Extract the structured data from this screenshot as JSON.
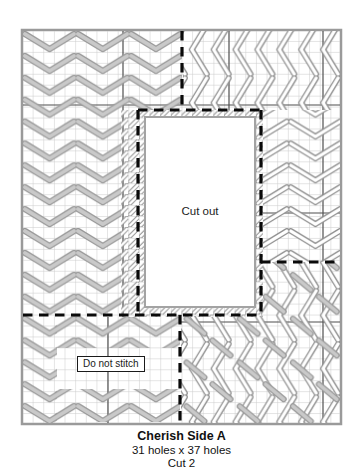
{
  "chart": {
    "cutout_label": "Cut out",
    "do_not_stitch_label": "Do not stitch"
  },
  "caption": {
    "title": "Cherish Side A",
    "size": "31 holes x 37 holes",
    "cut": "Cut 2"
  },
  "legend_colors": {
    "stitch_gray_fill": "#c9c9c9",
    "stitch_white_fill": "#ffffff",
    "stitch_outline": "#8f8f8f",
    "grid_line": "#cacaca",
    "grid_bold_line": "#4f4f4f",
    "cut_line": "#000000",
    "canvas_border": "#9a9a9a"
  }
}
